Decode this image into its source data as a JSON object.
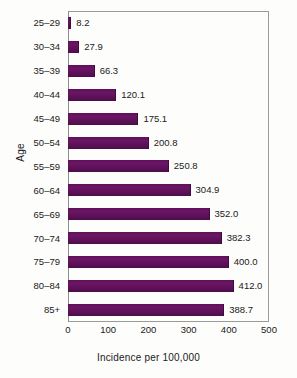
{
  "chart_data": {
    "type": "bar",
    "orientation": "horizontal",
    "title": "",
    "xlabel": "Incidence per 100,000",
    "ylabel": "Age",
    "xlim": [
      0,
      500
    ],
    "xticks": [
      0,
      100,
      200,
      300,
      400,
      500
    ],
    "xtick_labels": [
      "0",
      "100",
      "200",
      "300",
      "400",
      "500"
    ],
    "grid": false,
    "legend": false,
    "bar_color": "#5d1158",
    "categories": [
      "25–29",
      "30–34",
      "35–39",
      "40–44",
      "45–49",
      "50–54",
      "55–59",
      "60–64",
      "65–69",
      "70–74",
      "75–79",
      "80–84",
      "85+"
    ],
    "values": [
      8.2,
      27.9,
      66.3,
      120.1,
      175.1,
      200.8,
      250.8,
      304.9,
      352.0,
      382.3,
      400.0,
      412.0,
      388.7
    ],
    "value_labels": [
      "8.2",
      "27.9",
      "66.3",
      "120.1",
      "175.1",
      "200.8",
      "250.8",
      "304.9",
      "352.0",
      "382.3",
      "400.0",
      "412.0",
      "388.7"
    ]
  }
}
